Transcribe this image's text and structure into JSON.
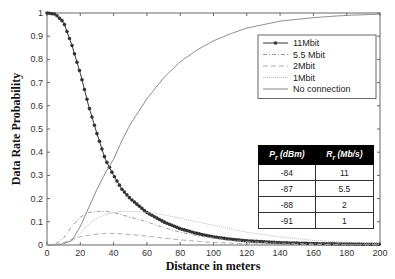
{
  "chart_data": {
    "type": "line",
    "title": "",
    "xlabel": "Distance in meters",
    "ylabel": "Data Rate Probability",
    "xlim": [
      0,
      200
    ],
    "ylim": [
      0,
      1
    ],
    "xticks": [
      0,
      20,
      40,
      60,
      80,
      100,
      120,
      140,
      160,
      180,
      200
    ],
    "yticks": [
      0,
      0.1,
      0.2,
      0.3,
      0.4,
      0.5,
      0.6,
      0.7,
      0.8,
      0.9,
      1
    ],
    "grid": false,
    "legend_position": "upper right",
    "x": [
      0,
      5,
      10,
      15,
      20,
      25,
      30,
      35,
      40,
      45,
      50,
      60,
      70,
      80,
      90,
      100,
      110,
      120,
      140,
      160,
      180,
      200
    ],
    "series": [
      {
        "name": "11Mbit",
        "style": "solid-dot-markers",
        "values": [
          1.0,
          0.995,
          0.96,
          0.86,
          0.74,
          0.6,
          0.48,
          0.37,
          0.3,
          0.24,
          0.2,
          0.14,
          0.1,
          0.07,
          0.05,
          0.035,
          0.025,
          0.018,
          0.01,
          0.006,
          0.004,
          0.003
        ]
      },
      {
        "name": "5.5 Mbit",
        "style": "dash-dot",
        "values": [
          0,
          0.005,
          0.03,
          0.08,
          0.12,
          0.14,
          0.145,
          0.145,
          0.14,
          0.13,
          0.12,
          0.1,
          0.075,
          0.055,
          0.04,
          0.03,
          0.02,
          0.015,
          0.008,
          0.005,
          0.003,
          0.002
        ]
      },
      {
        "name": "2Mbit",
        "style": "dashed",
        "values": [
          0,
          0.002,
          0.01,
          0.025,
          0.035,
          0.042,
          0.047,
          0.05,
          0.05,
          0.048,
          0.045,
          0.038,
          0.03,
          0.022,
          0.016,
          0.011,
          0.008,
          0.005,
          0.003,
          0.002,
          0.001,
          0.001
        ]
      },
      {
        "name": "1Mbit",
        "style": "dotted",
        "values": [
          0,
          0.001,
          0.005,
          0.02,
          0.05,
          0.09,
          0.115,
          0.13,
          0.14,
          0.145,
          0.145,
          0.14,
          0.13,
          0.115,
          0.1,
          0.085,
          0.07,
          0.055,
          0.035,
          0.02,
          0.012,
          0.007
        ]
      },
      {
        "name": "No connection",
        "style": "solid",
        "values": [
          0,
          0,
          0.005,
          0.02,
          0.08,
          0.16,
          0.24,
          0.31,
          0.37,
          0.45,
          0.52,
          0.63,
          0.72,
          0.79,
          0.84,
          0.88,
          0.91,
          0.935,
          0.965,
          0.98,
          0.99,
          0.995
        ]
      }
    ],
    "inset_table": {
      "headers": [
        "P_r (dBm)",
        "R_r (Mb/s)"
      ],
      "rows": [
        [
          "-84",
          "11"
        ],
        [
          "-87",
          "5.5"
        ],
        [
          "-88",
          "2"
        ],
        [
          "-91",
          "1"
        ]
      ]
    }
  },
  "axes": {
    "xlabel": "Distance in meters",
    "ylabel": "Data Rate Probability",
    "xtick_labels": [
      "0",
      "20",
      "40",
      "60",
      "80",
      "100",
      "120",
      "140",
      "160",
      "180",
      "200"
    ],
    "ytick_labels": [
      "0",
      "0.1",
      "0.2",
      "0.3",
      "0.4",
      "0.5",
      "0.6",
      "0.7",
      "0.8",
      "0.9",
      "1"
    ]
  },
  "legend": {
    "items": [
      "11Mbit",
      "5.5 Mbit",
      "2Mbit",
      "1Mbit",
      "No connection"
    ]
  },
  "table": {
    "header_pr": "P",
    "header_pr_sub": "r",
    "header_pr_unit": " (dBm)",
    "header_rr": "R",
    "header_rr_sub": "r",
    "header_rr_unit": " (Mb/s)",
    "rows": [
      {
        "pr": "-84",
        "rr": "11"
      },
      {
        "pr": "-87",
        "rr": "5.5"
      },
      {
        "pr": "-88",
        "rr": "2"
      },
      {
        "pr": "-91",
        "rr": "1"
      }
    ]
  }
}
